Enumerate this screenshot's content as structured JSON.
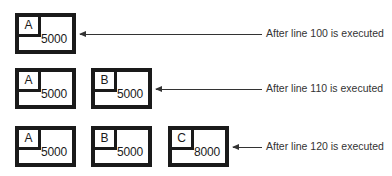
{
  "diagram": {
    "title": "",
    "rows": [
      {
        "caption": "After line 100 is executed",
        "variables": [
          {
            "name": "A",
            "value": "5000"
          }
        ]
      },
      {
        "caption": "After line 110 is executed",
        "variables": [
          {
            "name": "A",
            "value": "5000"
          },
          {
            "name": "B",
            "value": "5000"
          }
        ]
      },
      {
        "caption": "After line 120 is executed",
        "variables": [
          {
            "name": "A",
            "value": "5000"
          },
          {
            "name": "B",
            "value": "5000"
          },
          {
            "name": "C",
            "value": "8000"
          }
        ]
      }
    ],
    "colors": {
      "stroke": "#1a1a1a",
      "background": "#ffffff",
      "text": "#333333"
    }
  }
}
